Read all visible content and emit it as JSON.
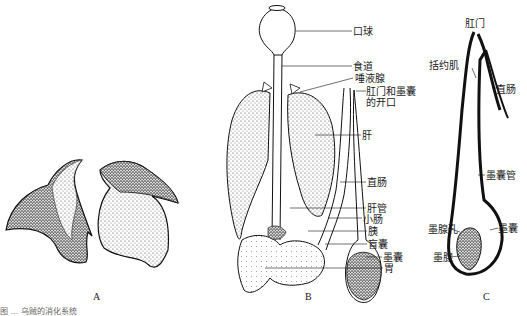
{
  "figure": {
    "panels": [
      {
        "id": "A",
        "label": "A"
      },
      {
        "id": "B",
        "label": "B"
      },
      {
        "id": "C",
        "label": "C"
      }
    ],
    "panel_b_labels": [
      "口球",
      "食道",
      "唾液腺",
      "肛门和墨囊",
      "的开口",
      "肝",
      "直肠",
      "肝管",
      "小肠",
      "胰",
      "盲囊",
      "墨囊",
      "胃"
    ],
    "panel_c_labels": [
      "肛门",
      "括约肌",
      "直肠",
      "墨囊管",
      "墨囊",
      "墨腺孔",
      "墨腺"
    ],
    "caption": "图 … 乌贼的消化系统"
  }
}
